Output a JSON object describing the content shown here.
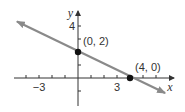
{
  "chart_data": {
    "type": "line",
    "title": "",
    "xlabel": "x",
    "ylabel": "y",
    "xlim": [
      -4.5,
      7.3
    ],
    "ylim": [
      -2,
      5
    ],
    "grid": false,
    "legend": null,
    "x_tick_labels": [
      {
        "value": -3,
        "label": "−3"
      },
      {
        "value": 3,
        "label": "3"
      }
    ],
    "y_tick_labels": [
      {
        "value": 4,
        "label": "4"
      }
    ],
    "x_ticks": [
      -4,
      -3,
      -2,
      -1,
      1,
      2,
      3,
      4,
      5,
      6
    ],
    "y_ticks": [
      -1,
      1,
      2,
      3,
      4
    ],
    "series": [
      {
        "name": "line",
        "equation": "y = -x/2 + 2",
        "x": [
          -4.7,
          6.7
        ],
        "y": [
          4.35,
          -1.15
        ],
        "color": "#8a8a8a",
        "arrows": "both"
      }
    ],
    "points": [
      {
        "x": 0,
        "y": 2,
        "label": "(0, 2)"
      },
      {
        "x": 4,
        "y": 0,
        "label": "(4, 0)"
      }
    ]
  },
  "colors": {
    "axis": "#333333",
    "line": "#8a8a8a",
    "point": "#111111"
  }
}
